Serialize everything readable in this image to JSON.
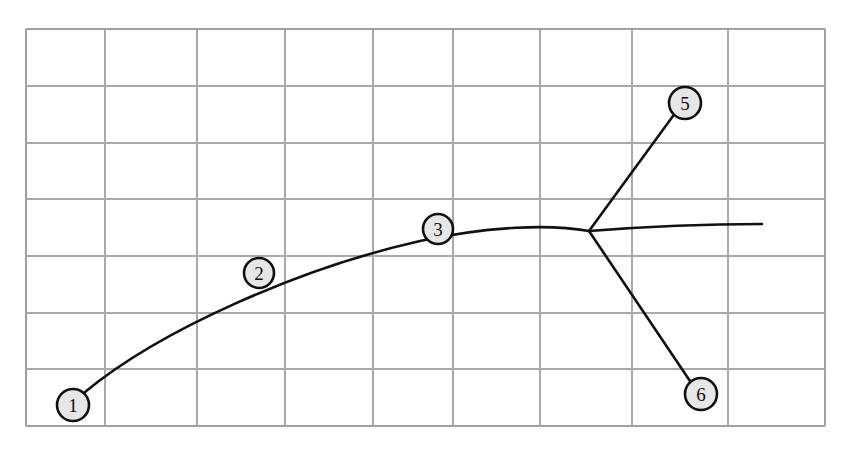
{
  "diagram": {
    "type": "line-diagram",
    "canvas": {
      "width": 847,
      "height": 451,
      "background": "#ffffff"
    },
    "grid": {
      "visible": true,
      "line_color": "#a9a9a9",
      "frame_color": "#a0a0a0",
      "left": 26,
      "top": 29,
      "right": 825,
      "bottom": 426,
      "columns": 9,
      "rows": 7,
      "x_lines": [
        26,
        105,
        197,
        285,
        373,
        453,
        540,
        632,
        728,
        825
      ],
      "y_lines": [
        29,
        86,
        143,
        199,
        256,
        313,
        369,
        426
      ]
    },
    "style": {
      "stroke_color": "#111111",
      "stroke_width": 2.6,
      "node_fill": "#e6e6e6",
      "node_stroke": "#101010",
      "node_radius": 16
    },
    "nodes": [
      {
        "id": "1",
        "label": "1",
        "cx": 73,
        "cy": 405,
        "r": 16
      },
      {
        "id": "2",
        "label": "2",
        "cx": 259,
        "cy": 273,
        "r": 15
      },
      {
        "id": "3",
        "label": "3",
        "cx": 438,
        "cy": 229,
        "r": 15
      },
      {
        "id": "5",
        "label": "5",
        "cx": 685,
        "cy": 103,
        "r": 16
      },
      {
        "id": "6",
        "label": "6",
        "cx": 701,
        "cy": 394,
        "r": 16
      }
    ],
    "edges": [
      {
        "id": "main-curve",
        "from": "1",
        "to": "junction",
        "kind": "curve",
        "path": "M 85,392 C 160,330 300,268 420,241 C 490,226 550,224 589,231",
        "passes_through": [
          "2",
          "3"
        ]
      },
      {
        "id": "junction-tail",
        "from": "junction",
        "to": "tail-end",
        "kind": "curve",
        "path": "M 589,231 C 640,227 710,224 762,224"
      },
      {
        "id": "branch-upper",
        "from": "junction",
        "to": "5",
        "kind": "line",
        "path": "M 589,231 L 673,116"
      },
      {
        "id": "branch-lower",
        "from": "junction",
        "to": "6",
        "kind": "line",
        "path": "M 589,231 L 690,381"
      }
    ],
    "junction": {
      "id": "junction",
      "x": 589,
      "y": 231,
      "degree": 4
    },
    "tail_end": {
      "id": "tail-end",
      "x": 762,
      "y": 224
    }
  },
  "chart_data": {
    "type": "line",
    "xlabel": "",
    "ylabel": "",
    "grid": true,
    "legend": "none",
    "xlim": [
      26,
      825
    ],
    "ylim": [
      29,
      426
    ],
    "annotations": [
      "1",
      "2",
      "3",
      "5",
      "6"
    ],
    "series": [
      {
        "name": "main-curve",
        "points": [
          [
            85,
            392
          ],
          [
            160,
            340
          ],
          [
            259,
            288
          ],
          [
            360,
            252
          ],
          [
            438,
            238
          ],
          [
            520,
            232
          ],
          [
            589,
            231
          ]
        ]
      },
      {
        "name": "junction-tail",
        "points": [
          [
            589,
            231
          ],
          [
            660,
            226
          ],
          [
            720,
            224
          ],
          [
            762,
            224
          ]
        ]
      },
      {
        "name": "branch-upper",
        "points": [
          [
            589,
            231
          ],
          [
            673,
            116
          ]
        ]
      },
      {
        "name": "branch-lower",
        "points": [
          [
            589,
            231
          ],
          [
            690,
            381
          ]
        ]
      }
    ]
  }
}
